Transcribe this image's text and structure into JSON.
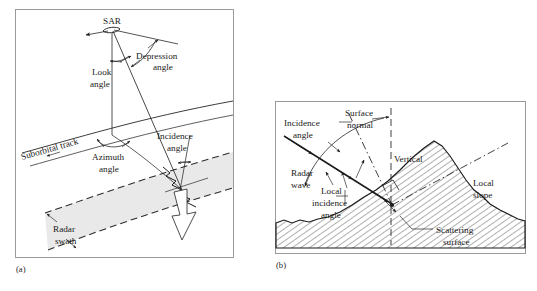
{
  "figure": {
    "type": "technical-diagram",
    "panels": [
      {
        "tag": "(a)",
        "name": "sar-viewing-geometry",
        "labels": {
          "platform": "SAR",
          "depression_angle": "Depression\nangle",
          "depression_angle_line1": "Depression",
          "depression_angle_line2": "angle",
          "look_angle_line1": "Look",
          "look_angle_line2": "angle",
          "suborbital_track": "Suborbital track",
          "azimuth_angle_line1": "Azimuth",
          "azimuth_angle_line2": "angle",
          "incidence_angle_line1": "Incidence",
          "incidence_angle_line2": "angle",
          "radar_swath_line1": "Radar",
          "radar_swath_line2": "swath"
        }
      },
      {
        "tag": "(b)",
        "name": "local-incidence-angle-geometry",
        "labels": {
          "incidence_angle_line1": "Incidence",
          "incidence_angle_line2": "angle",
          "surface_normal_line1": "Surface",
          "surface_normal_line2": "normal",
          "vertical": "Vertical",
          "radar_wave_line1": "Radar",
          "radar_wave_line2": "wave",
          "local_incidence_line1": "Local",
          "local_incidence_line2": "incidence",
          "local_incidence_line3": "angle",
          "local_slope_line1": "Local",
          "local_slope_line2": "slope",
          "scattering_surface_line1": "Scattering",
          "scattering_surface_line2": "surface"
        }
      }
    ],
    "colors": {
      "background": "#ffffff",
      "frame_stroke": "#9a9a9a",
      "line_stroke": "#1a1a1a",
      "swath_fill": "#e9e9e9",
      "text": "#1a1a1a"
    }
  }
}
